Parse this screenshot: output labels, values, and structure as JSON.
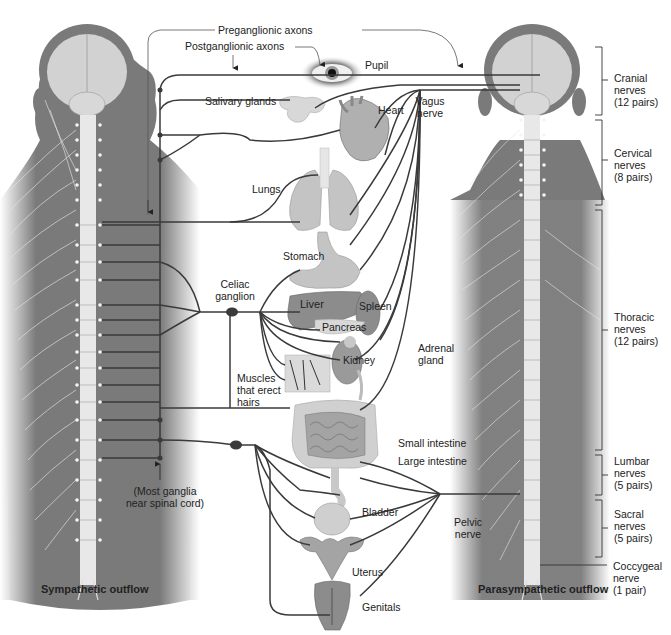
{
  "diagram": {
    "title_left": "Sympathetic outflow",
    "title_right": "Parasympathetic outflow",
    "axon_labels": {
      "preganglionic": "Preganglionic axons",
      "postganglionic": "Postganglionic axons"
    },
    "organs": {
      "pupil": "Pupil",
      "salivary_glands": "Salivary glands",
      "heart": "Heart",
      "lungs": "Lungs",
      "stomach": "Stomach",
      "liver": "Liver",
      "spleen": "Spleen",
      "pancreas": "Pancreas",
      "kidney": "Kidney",
      "adrenal_gland": "Adrenal\ngland",
      "muscles_hairs": "Muscles\nthat erect\nhairs",
      "small_intestine": "Small intestine",
      "large_intestine": "Large intestine",
      "bladder": "Bladder",
      "uterus": "Uterus",
      "genitals": "Genitals"
    },
    "nerves": {
      "vagus": "Vagus\nnerve",
      "pelvic": "Pelvic\nnerve",
      "celiac_ganglion": "Celiac\nganglion",
      "ganglia_note": "(Most ganglia\nnear spinal cord)"
    },
    "spinal_regions": [
      {
        "name": "Cranial\nnerves\n(12 pairs)"
      },
      {
        "name": "Cervical\nnerves\n(8 pairs)"
      },
      {
        "name": "Thoracic\nnerves\n(12 pairs)"
      },
      {
        "name": "Lumbar\nnerves\n(5 pairs)"
      },
      {
        "name": "Sacral\nnerves\n(5 pairs)"
      },
      {
        "name": "Coccygeal\nnerve\n(1 pair)"
      }
    ],
    "colors": {
      "body": "#7a7a7a",
      "brain": "#d2d2d2",
      "spine": "#e8e8e8",
      "nerve_line": "#3a3a3a",
      "organ": "#b8b8b8",
      "organ_dark": "#8c8c8c"
    }
  }
}
